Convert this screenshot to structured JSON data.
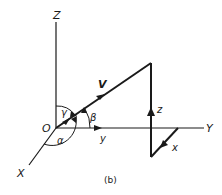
{
  "diagram": {
    "caption": "(b)",
    "axes": {
      "x_label": "X",
      "y_label": "Y",
      "z_label": "Z",
      "origin_label": "O"
    },
    "vector_label": "V",
    "angles": {
      "alpha": "α",
      "beta": "β",
      "gamma": "γ"
    },
    "components": {
      "x": "x",
      "y": "y",
      "z": "z"
    },
    "colors": {
      "line": "#1a1a1a",
      "background": "#ffffff"
    }
  }
}
